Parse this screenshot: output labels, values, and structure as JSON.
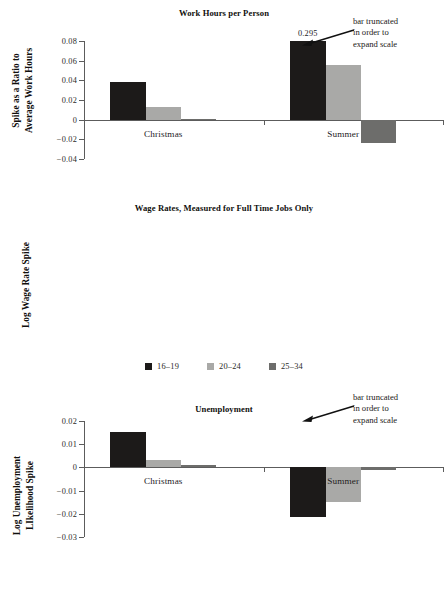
{
  "figure": {
    "legend": {
      "position": "between-panel-2-and-panel-3",
      "entries": [
        {
          "label": "16–19",
          "color": "#1c1a19",
          "swatch_name": "legend-swatch-16-19"
        },
        {
          "label": "20–24",
          "color": "#a9a9a7",
          "swatch_name": "legend-swatch-20-24"
        },
        {
          "label": "25–34",
          "color": "#6d6d6b",
          "swatch_name": "legend-swatch-25-34"
        }
      ]
    },
    "annotation_text": {
      "line1": "bar truncated",
      "line2": "in order to",
      "line3": "expand scale"
    }
  },
  "chart_data": [
    {
      "type": "bar",
      "panel": 1,
      "title": "Work Hours per Person",
      "xlabel": "",
      "ylabel": "Spike as a Ratio to Average Work Hours",
      "ylabel_line1": "Spike as a Ratio to",
      "ylabel_line2": "Average Work Hours",
      "categories": [
        "Christmas",
        "Summer"
      ],
      "ylim": [
        -0.04,
        0.08
      ],
      "yticks": [
        0.08,
        0.06,
        0.04,
        0.02,
        0,
        -0.02,
        -0.04
      ],
      "ytick_labels": [
        "0.08",
        "0.06",
        "0.04",
        "0.02",
        "0",
        "−0.02",
        "−0.04"
      ],
      "grid": false,
      "series": [
        {
          "name": "16–19",
          "color": "#1c1a19",
          "values": [
            0.038,
            0.295
          ]
        },
        {
          "name": "20–24",
          "color": "#a9a9a7",
          "values": [
            0.013,
            0.056
          ]
        },
        {
          "name": "25–34",
          "color": "#6d6d6b",
          "values": [
            0.0008,
            -0.024
          ]
        }
      ],
      "truncated_bars": [
        {
          "category": "Summer",
          "series": "16–19",
          "true_value": 0.295,
          "label": "0.295",
          "drawn_to": 0.08
        }
      ]
    },
    {
      "type": "bar",
      "panel": 2,
      "title": "Wage Rates, Measured for Full Time Jobs Only",
      "xlabel": "",
      "ylabel": "Log Wage Rate Spike",
      "categories": [
        "Christmas",
        "Summer"
      ],
      "ylim": [
        -0.03,
        0.02
      ],
      "yticks": [
        0.02,
        0.01,
        0,
        -0.01,
        -0.02,
        -0.03
      ],
      "ytick_labels": [
        "0.02",
        "0.01",
        "0",
        "−0.01",
        "−0.02",
        "−0.03"
      ],
      "grid": false,
      "series": [
        {
          "name": "16–19",
          "color": "#1c1a19",
          "values": [
            0.0152,
            -0.0212
          ]
        },
        {
          "name": "20–24",
          "color": "#a9a9a7",
          "values": [
            0.0031,
            -0.0151
          ]
        },
        {
          "name": "25–34",
          "color": "#6d6d6b",
          "values": [
            0.0009,
            -0.0012
          ]
        }
      ],
      "truncated_bars": []
    },
    {
      "type": "bar",
      "panel": 3,
      "title": "Unemployment",
      "xlabel": "",
      "ylabel": "Log Unemployment LIkelihood Spike",
      "ylabel_line1": "Log Unemployment",
      "ylabel_line2": "LIkelihood Spike",
      "categories": [
        "Christmas",
        "Summer"
      ],
      "ylim": [
        -0.1,
        0.15
      ],
      "yticks": [
        0.15,
        0.1,
        0.05,
        0,
        -0.05,
        -0.1
      ],
      "ytick_labels": [
        "0.15",
        "0.1",
        "0.05",
        "0",
        "−0.05",
        "−0.1"
      ],
      "grid": false,
      "series": [
        {
          "name": "16–19",
          "color": "#1c1a19",
          "values": [
            -0.003,
            0.295
          ]
        },
        {
          "name": "20–24",
          "color": "#a9a9a7",
          "values": [
            -0.082,
            0.093
          ]
        },
        {
          "name": "25–34",
          "color": "#6d6d6b",
          "values": [
            -0.014,
            0.047
          ]
        }
      ],
      "truncated_bars": [
        {
          "category": "Summer",
          "series": "16–19",
          "true_value": 0.295,
          "label": "0.295",
          "drawn_to": 0.15
        }
      ]
    }
  ]
}
